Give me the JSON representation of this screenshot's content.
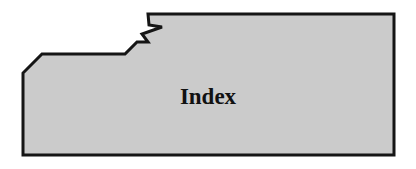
{
  "diagram": {
    "shape": "torn-folder-tab",
    "label": "Index",
    "colors": {
      "fill": "#cbcbcb",
      "stroke": "#151515",
      "text": "#111111",
      "background": "#ffffff"
    }
  }
}
